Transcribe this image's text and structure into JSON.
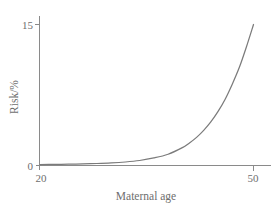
{
  "chart_data": {
    "type": "line",
    "title": "",
    "xlabel": "Maternal age",
    "ylabel": "Risk/%",
    "xlim": [
      20,
      50
    ],
    "ylim": [
      0,
      15
    ],
    "grid": false,
    "legend": null,
    "x_ticks": [
      {
        "value": 20,
        "label": "20"
      },
      {
        "value": 50,
        "label": "50"
      }
    ],
    "y_ticks": [
      {
        "value": 0,
        "label": "0"
      },
      {
        "value": 15,
        "label": "15"
      }
    ],
    "series": [
      {
        "name": "Risk",
        "color": "#7b7b7b",
        "x": [
          20,
          22,
          24,
          26,
          28,
          30,
          32,
          34,
          36,
          38,
          40,
          41,
          42,
          43,
          44,
          45,
          46,
          47,
          48,
          49,
          50
        ],
        "values": [
          0.05,
          0.07,
          0.09,
          0.12,
          0.16,
          0.22,
          0.32,
          0.48,
          0.75,
          1.15,
          1.85,
          2.35,
          2.95,
          3.7,
          4.6,
          5.7,
          7.0,
          8.6,
          10.4,
          12.6,
          15.0
        ]
      }
    ],
    "annotations": []
  },
  "axis": {
    "y_title": "Risk/%",
    "x_title": "Maternal age",
    "y_tick_top": "15",
    "y_tick_bottom": "0",
    "x_tick_left": "20",
    "x_tick_right": "50"
  },
  "colors": {
    "curve": "#7b7b7b",
    "axis": "#8a8a8a",
    "text": "#6e6e6e",
    "background": "#ffffff"
  }
}
